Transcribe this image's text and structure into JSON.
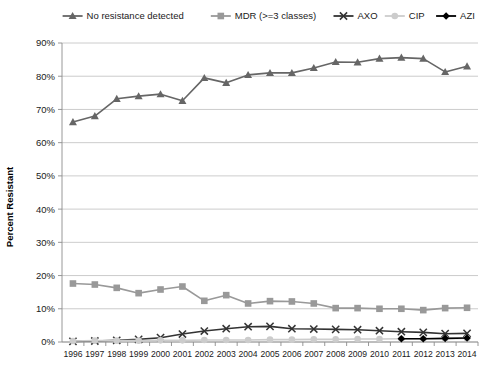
{
  "chart_data": {
    "type": "line",
    "title": "",
    "xlabel": "",
    "ylabel": "Percent Resistant",
    "ylim": [
      0,
      90
    ],
    "ytick_labels": [
      "0%",
      "10%",
      "20%",
      "30%",
      "40%",
      "50%",
      "60%",
      "70%",
      "80%",
      "90%"
    ],
    "ytick_values": [
      0,
      10,
      20,
      30,
      40,
      50,
      60,
      70,
      80,
      90
    ],
    "grid": true,
    "legend_position": "top",
    "categories": [
      "1996",
      "1997",
      "1998",
      "1999",
      "2000",
      "2001",
      "2002",
      "2003",
      "2004",
      "2005",
      "2006",
      "2007",
      "2008",
      "2009",
      "2010",
      "2011",
      "2012",
      "2013",
      "2014"
    ],
    "series": [
      {
        "name": "No resistance detected",
        "color": "#666666",
        "marker": "triangle",
        "values": [
          66.2,
          68.0,
          73.2,
          74.0,
          74.6,
          72.6,
          79.5,
          78.0,
          80.4,
          81.0,
          81.0,
          82.5,
          84.3,
          84.2,
          85.3,
          85.6,
          85.3,
          81.3,
          83.0
        ]
      },
      {
        "name": "MDR (>=3 classes)",
        "color": "#999999",
        "marker": "square",
        "values": [
          17.6,
          17.3,
          16.3,
          14.7,
          15.8,
          16.7,
          12.4,
          14.1,
          11.6,
          12.3,
          12.2,
          11.6,
          10.2,
          10.2,
          10.0,
          10.0,
          9.6,
          10.2,
          10.3
        ]
      },
      {
        "name": "AXO",
        "color": "#333333",
        "marker": "x",
        "values": [
          0.2,
          0.3,
          0.5,
          0.8,
          1.3,
          2.4,
          3.3,
          4.0,
          4.6,
          4.7,
          4.0,
          3.9,
          3.8,
          3.7,
          3.4,
          3.1,
          2.9,
          2.5,
          2.6
        ]
      },
      {
        "name": "CIP",
        "color": "#cccccc",
        "marker": "circle",
        "values": [
          0.3,
          0.4,
          0.4,
          0.4,
          0.5,
          0.5,
          0.6,
          0.6,
          0.6,
          0.7,
          0.7,
          0.8,
          0.8,
          0.9,
          0.9,
          1.0,
          1.0,
          1.0,
          1.1
        ]
      },
      {
        "name": "AZI",
        "color": "#000000",
        "marker": "diamond",
        "values": [
          null,
          null,
          null,
          null,
          null,
          null,
          null,
          null,
          null,
          null,
          null,
          null,
          null,
          null,
          null,
          1.0,
          1.0,
          1.1,
          1.2
        ]
      }
    ]
  }
}
